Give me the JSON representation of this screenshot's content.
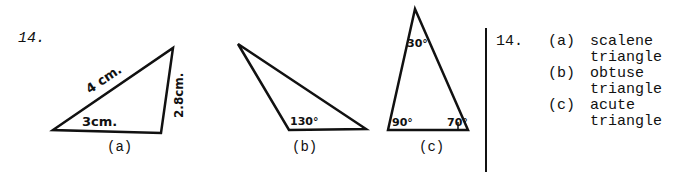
{
  "problem": {
    "number": "14.",
    "figures": [
      {
        "id": "a",
        "caption": "(a)",
        "labels": {
          "side_long": "4 cm.",
          "side_base": "3cm.",
          "side_right": "2.8cm."
        }
      },
      {
        "id": "b",
        "caption": "(b)",
        "labels": {
          "angle": "130°"
        }
      },
      {
        "id": "c",
        "caption": "(c)",
        "labels": {
          "angle_top": "30°",
          "angle_left": "90°",
          "angle_right": "70°"
        }
      }
    ]
  },
  "answers": {
    "number": "14.",
    "items": [
      {
        "letter": "(a)",
        "line1": "scalene",
        "line2": "triangle"
      },
      {
        "letter": "(b)",
        "line1": "obtuse",
        "line2": "triangle"
      },
      {
        "letter": "(c)",
        "line1": "acute",
        "line2": "triangle"
      }
    ]
  }
}
